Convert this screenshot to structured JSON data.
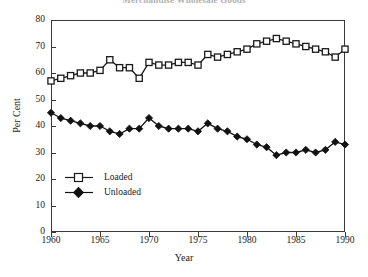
{
  "chart_data": {
    "type": "line",
    "title": "Merchandise Wholesale Goods",
    "xlabel": "Year",
    "ylabel": "Per Cent",
    "xlim": [
      1960,
      1990
    ],
    "ylim": [
      0,
      80
    ],
    "xticks": [
      1960,
      1965,
      1970,
      1975,
      1980,
      1985,
      1990
    ],
    "yticks": [
      0,
      10,
      20,
      30,
      40,
      50,
      60,
      70,
      80
    ],
    "grid": false,
    "legend_position": "lower-left-inside",
    "x": [
      1960,
      1961,
      1962,
      1963,
      1964,
      1965,
      1966,
      1967,
      1968,
      1969,
      1970,
      1971,
      1972,
      1973,
      1974,
      1975,
      1976,
      1977,
      1978,
      1979,
      1980,
      1981,
      1982,
      1983,
      1984,
      1985,
      1986,
      1987,
      1988,
      1989,
      1990
    ],
    "series": [
      {
        "name": "Loaded",
        "marker": "open-square",
        "values": [
          57,
          58,
          59,
          60,
          60,
          61,
          65,
          62,
          62,
          58,
          64,
          63,
          63,
          64,
          64,
          63,
          67,
          66,
          67,
          68,
          69,
          71,
          72,
          73,
          72,
          71,
          70,
          69,
          68,
          66,
          69
        ]
      },
      {
        "name": "Unloaded",
        "marker": "filled-diamond",
        "values": [
          45,
          43,
          42,
          41,
          40,
          40,
          38,
          37,
          39,
          39,
          43,
          40,
          39,
          39,
          39,
          38,
          41,
          39,
          38,
          36,
          35,
          33,
          32,
          29,
          30,
          30,
          31,
          30,
          31,
          34,
          33
        ]
      }
    ]
  },
  "legend": {
    "items": [
      {
        "label": "Loaded"
      },
      {
        "label": "Unloaded"
      }
    ]
  },
  "axes": {
    "y_tick_labels": [
      "80",
      "70",
      "60",
      "50",
      "40",
      "30",
      "20",
      "10",
      "0"
    ],
    "x_tick_labels": [
      "1960",
      "1965",
      "1970",
      "1975",
      "1980",
      "1985",
      "1990"
    ]
  },
  "colors": {
    "axis": "#3a3a3a",
    "series_loaded": "#1a1a1a",
    "series_unloaded": "#111111",
    "background": "#ffffff"
  }
}
